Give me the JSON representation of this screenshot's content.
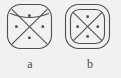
{
  "figure": {
    "type": "line-diagram-pair",
    "background_color": "#f2f1ef",
    "stroke_color": "#4f4f4f",
    "dot_color": "#3d3d3d",
    "panels": [
      {
        "id": "a",
        "label": "a",
        "description": "Rounded square outline with diagonal cross (X) connecting the four corners, four small square dots placed one in each quadrant, and a shallow arc across the upper region forming a lens shape with the top edge.",
        "shapes": [
          "rounded-square-outline",
          "top-arc",
          "diagonal-cross",
          "four-dots"
        ],
        "dot_count": 4
      },
      {
        "id": "b",
        "label": "b",
        "description": "Outer rounded square outline containing a concentric inner rounded square, with a diagonal cross (X) spanning the inner square and four small square dots, one in each quadrant.",
        "shapes": [
          "outer-rounded-square-outline",
          "inner-rounded-square-outline",
          "diagonal-cross",
          "four-dots"
        ],
        "dot_count": 4
      }
    ]
  }
}
